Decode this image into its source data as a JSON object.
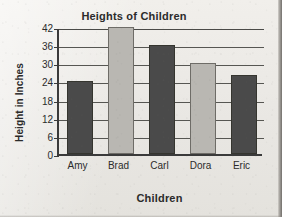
{
  "chart_data": {
    "type": "bar",
    "title": "Heights of Children",
    "xlabel": "Children",
    "ylabel": "Height in Inches",
    "categories": [
      "Amy",
      "Brad",
      "Carl",
      "Dora",
      "Eric"
    ],
    "values": [
      24,
      42,
      36,
      30,
      26
    ],
    "ylim": [
      0,
      42
    ],
    "ytick_labels": [
      "42",
      "36",
      "30",
      "24",
      "18",
      "12",
      "6",
      "0"
    ],
    "ytick_values": [
      42,
      36,
      30,
      24,
      18,
      12,
      6,
      0
    ],
    "ytick_step": 6,
    "grid": true,
    "legend": false,
    "bar_colors": [
      "#4a4a4a",
      "#b9b7b2",
      "#4a4a4a",
      "#b9b7b2",
      "#4a4a4a"
    ],
    "series": [
      {
        "name": "Height in Inches",
        "values": [
          24,
          42,
          36,
          30,
          26
        ]
      }
    ],
    "points": [
      {
        "label": "Amy",
        "value": 24,
        "color": "#4a4a4a"
      },
      {
        "label": "Brad",
        "value": 42,
        "color": "#b9b7b2"
      },
      {
        "label": "Carl",
        "value": 36,
        "color": "#4a4a4a"
      },
      {
        "label": "Dora",
        "value": 30,
        "color": "#b9b7b2"
      },
      {
        "label": "Eric",
        "value": 26,
        "color": "#4a4a4a"
      }
    ],
    "colors": {
      "bar_dark": "#4a4a4a",
      "bar_light": "#b9b7b2",
      "axis": "#3a3a3a",
      "grid": "#565652",
      "text": "#2b2b2b",
      "background": "#eceae6"
    }
  }
}
